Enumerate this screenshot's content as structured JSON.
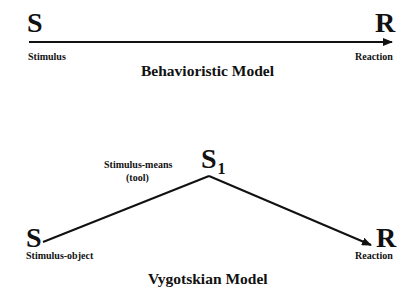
{
  "behavioristic": {
    "title": "Behavioristic Model",
    "stimulus_node": {
      "symbol": "S",
      "label": "Stimulus"
    },
    "reaction_node": {
      "symbol": "R",
      "label": "Reaction"
    },
    "edges": [
      {
        "from": "S",
        "to": "R",
        "type": "arrow"
      }
    ]
  },
  "vygotskian": {
    "title": "Vygotskian Model",
    "stimulus_object_node": {
      "symbol": "S",
      "label": "Stimulus-object"
    },
    "means_node": {
      "symbol": "S",
      "subscript": "1",
      "label_line1": "Stimulus-means",
      "label_line2": "(tool)"
    },
    "reaction_node": {
      "symbol": "R",
      "label": "Reaction"
    },
    "edges": [
      {
        "from": "S",
        "to": "S1",
        "type": "line"
      },
      {
        "from": "S1",
        "to": "R",
        "type": "arrow"
      }
    ]
  },
  "colors": {
    "ink": "#111111",
    "background": "#ffffff"
  }
}
